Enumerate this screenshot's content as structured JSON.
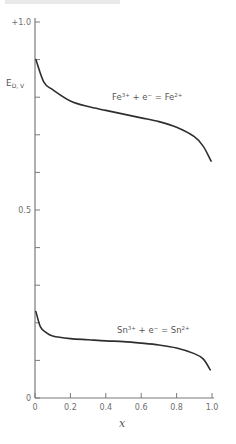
{
  "chart_data": {
    "type": "line",
    "title": "",
    "xlabel": "x",
    "ylabel": "E_{D,V}",
    "xlim": [
      0,
      1.0
    ],
    "ylim": [
      0,
      1.0
    ],
    "grid": false,
    "x_ticks": [
      "0",
      "0.2",
      "0.4",
      "0.6",
      "0.8",
      "1.0"
    ],
    "y_tick_labels": [
      {
        "value": 1.0,
        "label": "+1.0"
      },
      {
        "value": 0.5,
        "label": "0.5"
      },
      {
        "value": 0.0,
        "label": "0"
      }
    ],
    "y_minor_ticks": [
      0.8,
      0.6,
      0.4,
      0.3,
      0.2,
      0.1,
      0.9,
      0.7
    ],
    "series": [
      {
        "name": "Fe3+ + e- = Fe2+",
        "label_parts": {
          "a": "Fe",
          "a_sup": "3+",
          "op": " + e",
          "e_sup": "−",
          "eq": " = Fe",
          "b_sup": "2+"
        },
        "x": [
          0.005,
          0.05,
          0.1,
          0.2,
          0.3,
          0.4,
          0.5,
          0.6,
          0.7,
          0.8,
          0.9,
          0.95,
          0.995
        ],
        "values": [
          0.9,
          0.84,
          0.82,
          0.79,
          0.775,
          0.765,
          0.755,
          0.745,
          0.735,
          0.72,
          0.695,
          0.67,
          0.63
        ]
      },
      {
        "name": "Sn3+ + e- = Sn2+",
        "label_parts": {
          "a": "Sn",
          "a_sup": "3+",
          "op": " + e",
          "e_sup": "−",
          "eq": " = Sn",
          "b_sup": "2+"
        },
        "x": [
          0.005,
          0.03,
          0.06,
          0.1,
          0.2,
          0.3,
          0.4,
          0.5,
          0.6,
          0.7,
          0.8,
          0.9,
          0.95,
          0.99
        ],
        "values": [
          0.23,
          0.19,
          0.175,
          0.165,
          0.158,
          0.155,
          0.152,
          0.15,
          0.146,
          0.141,
          0.133,
          0.118,
          0.104,
          0.075
        ]
      }
    ]
  }
}
